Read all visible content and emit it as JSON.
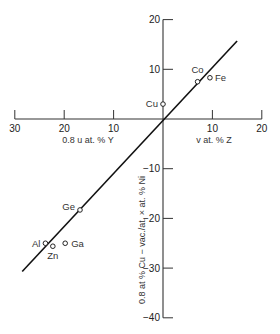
{
  "chart_data": {
    "type": "scatter",
    "title": "",
    "xlabel_left": "0.8 u at. % Y",
    "xlabel_right": "v at. % Z",
    "ylabel": "0.8 at % Cu − vac./at. × at. % Ni",
    "x_ticks": [
      {
        "value": -30,
        "label": "30"
      },
      {
        "value": -20,
        "label": "20"
      },
      {
        "value": -10,
        "label": "10"
      },
      {
        "value": 10,
        "label": "10"
      },
      {
        "value": 20,
        "label": "20"
      }
    ],
    "y_ticks": [
      {
        "value": 20,
        "label": "20"
      },
      {
        "value": 10,
        "label": "10"
      },
      {
        "value": -10,
        "label": "−10"
      },
      {
        "value": -20,
        "label": "−20"
      },
      {
        "value": -30,
        "label": "−30"
      },
      {
        "value": -40,
        "label": "−40"
      }
    ],
    "xlim": [
      -30,
      20
    ],
    "ylim": [
      -40,
      20
    ],
    "grid": false,
    "points": [
      {
        "label": "Cu",
        "x": 0,
        "y": 3
      },
      {
        "label": "Co",
        "x": 7,
        "y": 7.5
      },
      {
        "label": "Fe",
        "x": 9.5,
        "y": 8.3
      },
      {
        "label": "Ge",
        "x": -16.8,
        "y": -18.3
      },
      {
        "label": "Al",
        "x": -23.8,
        "y": -25
      },
      {
        "label": "Zn",
        "x": -22.3,
        "y": -25.6
      },
      {
        "label": "Ga",
        "x": -19.8,
        "y": -25
      }
    ],
    "fit_line": {
      "x1": -28.5,
      "y1": -30.7,
      "x2": 15,
      "y2": 15.7
    }
  },
  "labels": {
    "x_left": "0.8 u at. % Y",
    "x_right": "v at. % Z",
    "y_axis": "0.8 at % Cu − vac./at. × at. % Ni"
  }
}
